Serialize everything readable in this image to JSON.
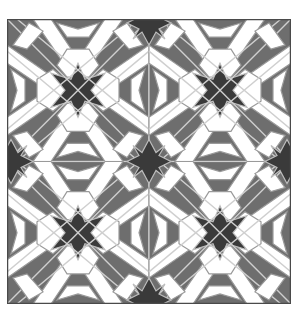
{
  "image": {
    "description": "Islamic geometric tessellation pattern, 2x2 repeat of square tiles",
    "tiles": {
      "rows": 2,
      "cols": 2
    },
    "colors": {
      "dark_star": "#3a3a3a",
      "mid_gray": "#6e6e6e",
      "frame": "#5a5a5a",
      "light": "#ffffff",
      "line": "#cfcfcf"
    },
    "motifs": [
      "eight-point-star",
      "four-point-star",
      "hexagon",
      "kite",
      "dart"
    ]
  }
}
